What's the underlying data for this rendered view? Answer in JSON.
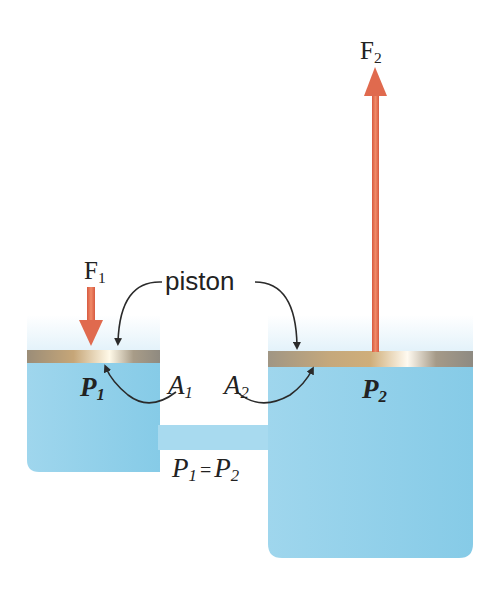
{
  "diagram": {
    "labels": {
      "force_input": {
        "main": "F",
        "sub": "1"
      },
      "force_output": {
        "main": "F",
        "sub": "2"
      },
      "piston": "piston",
      "pressure_left": {
        "main": "P",
        "sub": "1"
      },
      "pressure_right": {
        "main": "P",
        "sub": "2"
      },
      "area_left": {
        "main": "A",
        "sub": "1"
      },
      "area_right": {
        "main": "A",
        "sub": "2"
      },
      "equation": {
        "lhs_main": "P",
        "lhs_sub": "1",
        "op": "=",
        "rhs_main": "P",
        "rhs_sub": "2"
      }
    },
    "colors": {
      "fluid": "#8fd0ea",
      "fluid_light": "#c9e9f6",
      "piston": "#b9a079",
      "force_arrow": "#e06a4e",
      "text": "#222222"
    }
  }
}
